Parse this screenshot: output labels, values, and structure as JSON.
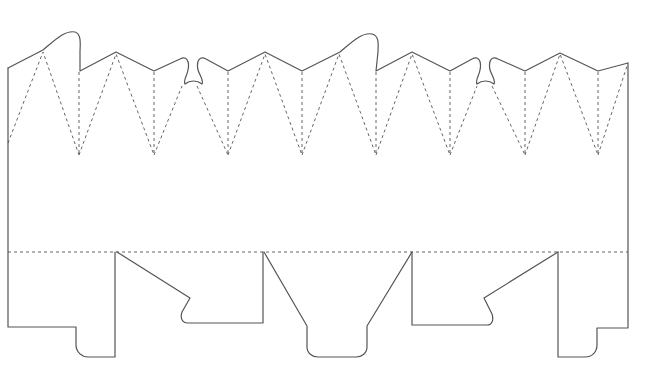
{
  "diagram": {
    "type": "packaging-dieline",
    "width": 664,
    "height": 384,
    "colors": {
      "background": "#ffffff",
      "cut_line": "#555555",
      "fold_line": "#666666"
    },
    "legend": [],
    "cut_paths": [
      {
        "name": "outline-top-edge",
        "d": "M8,68 L43,50 C55,40 65,30 75,32 C82,34 80,46 80,52 L80,71 L116,52 L154,71 L180,59 C186,56 190,60 188,70 C187,76 183,80 185,84 C190,80 197,80 202,84 C204,80 200,76 198,70 C196,60 200,56 206,59 L228,71 L265,52 L302,71 L340,52 C352,42 362,32 372,34 C380,36 378,46 378,52 L376,71 L412,52 L450,71 L472,59 C478,56 482,60 480,70 C479,76 475,80 477,84 C482,80 489,80 494,84 C496,80 492,76 490,70 C488,60 492,56 498,59 L525,71 L560,53 L598,71 L628,63"
      },
      {
        "name": "outline-left-edge",
        "d": "M8,68 L8,327 L76,327 L76,345 C76,352 82,357 88,357 L115,357 L115,252"
      },
      {
        "name": "left-dust-flap",
        "d": "M117,252 L190,298 L182,312 C180,318 182,323 188,323 L263,323 L263,252"
      },
      {
        "name": "center-bottom-tab",
        "d": "M264,252 L307,326 L307,347 C307,353 312,357 318,357 L356,357 C362,357 367,353 367,347 L367,326 L412,252"
      },
      {
        "name": "right-dust-flap",
        "d": "M412,252 L412,325 L487,325 C492,325 494,320 492,314 L484,298 L558,252"
      },
      {
        "name": "outline-right-edge",
        "d": "M558,252 L558,357 L585,357 C592,357 597,352 597,345 L597,328 L628,328 L628,63"
      }
    ],
    "fold_paths": [
      {
        "name": "horizontal-fold",
        "d": "M8,252 L628,252"
      },
      {
        "name": "top-fold-v-1",
        "d": "M8,143 L43,52 L79,155"
      },
      {
        "name": "top-fold-vert-1",
        "d": "M79,72 L79,155"
      },
      {
        "name": "top-fold-v-2",
        "d": "M79,155 L116,54 L154,155"
      },
      {
        "name": "top-fold-vert-2",
        "d": "M154,72 L154,155"
      },
      {
        "name": "top-fold-v-3",
        "d": "M154,155 L182,86"
      },
      {
        "name": "top-fold-v-4",
        "d": "M197,86 L228,155"
      },
      {
        "name": "top-fold-vert-3",
        "d": "M228,72 L228,155"
      },
      {
        "name": "top-fold-v-5",
        "d": "M228,155 L265,54 L302,155"
      },
      {
        "name": "top-fold-vert-4",
        "d": "M302,72 L302,155"
      },
      {
        "name": "top-fold-v-6",
        "d": "M302,155 L339,54 L376,155"
      },
      {
        "name": "top-fold-vert-5",
        "d": "M376,72 L376,155"
      },
      {
        "name": "top-fold-v-7",
        "d": "M376,155 L412,54 L450,155"
      },
      {
        "name": "top-fold-vert-6",
        "d": "M450,72 L450,155"
      },
      {
        "name": "top-fold-v-8",
        "d": "M450,155 L477,86"
      },
      {
        "name": "top-fold-v-9",
        "d": "M492,86 L525,155"
      },
      {
        "name": "top-fold-vert-7",
        "d": "M525,72 L525,155"
      },
      {
        "name": "top-fold-v-10",
        "d": "M525,155 L560,54 L598,155"
      },
      {
        "name": "top-fold-vert-8",
        "d": "M598,72 L598,155"
      },
      {
        "name": "top-fold-v-11",
        "d": "M598,155 L627,66"
      }
    ]
  }
}
